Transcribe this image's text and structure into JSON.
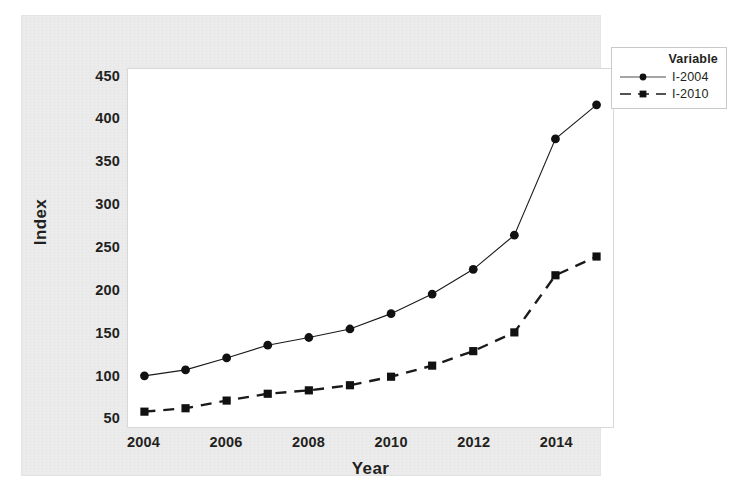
{
  "chart_data": {
    "type": "line",
    "title": "",
    "xlabel": "Year",
    "ylabel": "Index",
    "x": [
      2004,
      2005,
      2006,
      2007,
      2008,
      2009,
      2010,
      2011,
      2012,
      2013,
      2014,
      2015
    ],
    "xlim": [
      2003.6,
      2015.4
    ],
    "ylim": [
      40,
      460
    ],
    "xticks": [
      2004,
      2006,
      2008,
      2010,
      2012,
      2014
    ],
    "xtick_labels": [
      "2004",
      "2006",
      "2008",
      "2010",
      "2012",
      "2014"
    ],
    "yticks": [
      50,
      100,
      150,
      200,
      250,
      300,
      350,
      400,
      450
    ],
    "ytick_labels": [
      "50",
      "100",
      "150",
      "200",
      "250",
      "300",
      "350",
      "400",
      "450"
    ],
    "grid": false,
    "legend_position": "right",
    "legend_title": "Variable",
    "series": [
      {
        "name": "I-2004",
        "marker": "circle",
        "line_style": "solid",
        "color": "#1a1a1a",
        "values": [
          100,
          107,
          121,
          136,
          145,
          155,
          173,
          196,
          225,
          265,
          378,
          418
        ]
      },
      {
        "name": "I-2010",
        "marker": "square",
        "line_style": "dashed",
        "color": "#1a1a1a",
        "values": [
          58,
          62,
          71,
          79,
          83,
          89,
          99,
          112,
          129,
          151,
          218,
          240
        ]
      }
    ]
  },
  "colors": {
    "panel_background": "#ececec",
    "plot_background": "#ffffff",
    "ink": "#231f20",
    "axis_line": "#d8d8d8"
  }
}
